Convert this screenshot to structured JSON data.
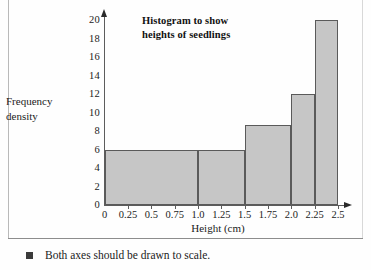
{
  "chart_data": {
    "type": "bar",
    "title": "Histogram to show heights of seedlings",
    "title_line1": "Histogram to show",
    "title_line2": "heights of seedlings",
    "xlabel": "Height (cm)",
    "ylabel": "Frequency density",
    "ylabel_line1": "Frequency",
    "ylabel_line2": "density",
    "xlim": [
      0,
      2.5
    ],
    "ylim": [
      0,
      20
    ],
    "grid": false,
    "legend": "none",
    "y_ticks": [
      "0",
      "2",
      "4",
      "6",
      "8",
      "10",
      "12",
      "14",
      "16",
      "18",
      "20"
    ],
    "y_tick_values": [
      0,
      2,
      4,
      6,
      8,
      10,
      12,
      14,
      16,
      18,
      20
    ],
    "x_ticks": [
      "0",
      "0.25",
      "0.5",
      "0.75",
      "1.0",
      "1.25",
      "1.5",
      "1.75",
      "2.0",
      "2.25",
      "2.5"
    ],
    "x_tick_values": [
      0,
      0.25,
      0.5,
      0.75,
      1.0,
      1.25,
      1.5,
      1.75,
      2.0,
      2.25,
      2.5
    ],
    "bars": [
      {
        "label": "0 - 1.0",
        "x_start": 0,
        "x_end": 1.0,
        "value": 6
      },
      {
        "label": "1.0 - 1.5",
        "x_start": 1.0,
        "x_end": 1.5,
        "value": 6
      },
      {
        "label": "1.5 - 2.0",
        "x_start": 1.5,
        "x_end": 2.0,
        "value": 8.7
      },
      {
        "label": "2.0 - 2.25",
        "x_start": 2.0,
        "x_end": 2.25,
        "value": 12
      },
      {
        "label": "2.25 - 2.5",
        "x_start": 2.25,
        "x_end": 2.5,
        "value": 20
      }
    ],
    "categories": [
      "0 - 1.0",
      "1.0 - 1.5",
      "1.5 - 2.0",
      "2.0 - 2.25",
      "2.25 - 2.5"
    ],
    "values": [
      6,
      6,
      8.7,
      12,
      20
    ],
    "bar_fill_color": "#c6c6c6",
    "bar_border_color": "#5a5a5a",
    "axis_color": "#5c5c5c"
  },
  "caption": {
    "bullet": "square-bullet",
    "text": "Both axes should be drawn to scale."
  }
}
